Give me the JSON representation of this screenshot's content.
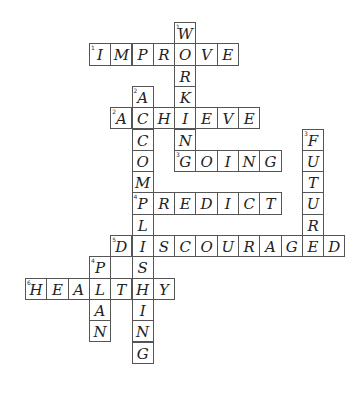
{
  "puzzle": {
    "cell_size": 21.3,
    "cells": [
      {
        "r": 0,
        "c": 7,
        "ch": "W",
        "n": "1"
      },
      {
        "r": 1,
        "c": 3,
        "ch": "I",
        "n": "1"
      },
      {
        "r": 1,
        "c": 4,
        "ch": "M"
      },
      {
        "r": 1,
        "c": 5,
        "ch": "P"
      },
      {
        "r": 1,
        "c": 6,
        "ch": "R"
      },
      {
        "r": 1,
        "c": 7,
        "ch": "O"
      },
      {
        "r": 1,
        "c": 8,
        "ch": "V"
      },
      {
        "r": 1,
        "c": 9,
        "ch": "E"
      },
      {
        "r": 2,
        "c": 7,
        "ch": "R"
      },
      {
        "r": 3,
        "c": 5,
        "ch": "A",
        "n": "2"
      },
      {
        "r": 3,
        "c": 7,
        "ch": "K"
      },
      {
        "r": 4,
        "c": 4,
        "ch": "A",
        "n": "2"
      },
      {
        "r": 4,
        "c": 5,
        "ch": "C"
      },
      {
        "r": 4,
        "c": 6,
        "ch": "H"
      },
      {
        "r": 4,
        "c": 7,
        "ch": "I"
      },
      {
        "r": 4,
        "c": 8,
        "ch": "E"
      },
      {
        "r": 4,
        "c": 9,
        "ch": "V"
      },
      {
        "r": 4,
        "c": 10,
        "ch": "E"
      },
      {
        "r": 5,
        "c": 5,
        "ch": "C"
      },
      {
        "r": 5,
        "c": 7,
        "ch": "N"
      },
      {
        "r": 5,
        "c": 13,
        "ch": "F",
        "n": "3"
      },
      {
        "r": 6,
        "c": 5,
        "ch": "O"
      },
      {
        "r": 6,
        "c": 7,
        "ch": "G",
        "n": "3"
      },
      {
        "r": 6,
        "c": 8,
        "ch": "O"
      },
      {
        "r": 6,
        "c": 9,
        "ch": "I"
      },
      {
        "r": 6,
        "c": 10,
        "ch": "N"
      },
      {
        "r": 6,
        "c": 11,
        "ch": "G"
      },
      {
        "r": 6,
        "c": 13,
        "ch": "U"
      },
      {
        "r": 7,
        "c": 5,
        "ch": "M"
      },
      {
        "r": 7,
        "c": 13,
        "ch": "T"
      },
      {
        "r": 8,
        "c": 5,
        "ch": "P",
        "n": "4"
      },
      {
        "r": 8,
        "c": 6,
        "ch": "R"
      },
      {
        "r": 8,
        "c": 7,
        "ch": "E"
      },
      {
        "r": 8,
        "c": 8,
        "ch": "D"
      },
      {
        "r": 8,
        "c": 9,
        "ch": "I"
      },
      {
        "r": 8,
        "c": 10,
        "ch": "C"
      },
      {
        "r": 8,
        "c": 11,
        "ch": "T"
      },
      {
        "r": 8,
        "c": 13,
        "ch": "U"
      },
      {
        "r": 9,
        "c": 5,
        "ch": "L"
      },
      {
        "r": 9,
        "c": 13,
        "ch": "R"
      },
      {
        "r": 10,
        "c": 4,
        "ch": "D",
        "n": "5"
      },
      {
        "r": 10,
        "c": 5,
        "ch": "I"
      },
      {
        "r": 10,
        "c": 6,
        "ch": "S"
      },
      {
        "r": 10,
        "c": 7,
        "ch": "C"
      },
      {
        "r": 10,
        "c": 8,
        "ch": "O"
      },
      {
        "r": 10,
        "c": 9,
        "ch": "U"
      },
      {
        "r": 10,
        "c": 10,
        "ch": "R"
      },
      {
        "r": 10,
        "c": 11,
        "ch": "A"
      },
      {
        "r": 10,
        "c": 12,
        "ch": "G"
      },
      {
        "r": 10,
        "c": 13,
        "ch": "E"
      },
      {
        "r": 10,
        "c": 14,
        "ch": "D"
      },
      {
        "r": 11,
        "c": 3,
        "ch": "P",
        "n": "4"
      },
      {
        "r": 11,
        "c": 5,
        "ch": "S"
      },
      {
        "r": 12,
        "c": 0,
        "ch": "H",
        "n": "6"
      },
      {
        "r": 12,
        "c": 1,
        "ch": "E"
      },
      {
        "r": 12,
        "c": 2,
        "ch": "A"
      },
      {
        "r": 12,
        "c": 3,
        "ch": "L"
      },
      {
        "r": 12,
        "c": 4,
        "ch": "T"
      },
      {
        "r": 12,
        "c": 5,
        "ch": "H"
      },
      {
        "r": 12,
        "c": 6,
        "ch": "Y"
      },
      {
        "r": 13,
        "c": 3,
        "ch": "A"
      },
      {
        "r": 13,
        "c": 5,
        "ch": "I"
      },
      {
        "r": 14,
        "c": 3,
        "ch": "N"
      },
      {
        "r": 14,
        "c": 5,
        "ch": "N"
      },
      {
        "r": 15,
        "c": 5,
        "ch": "G"
      }
    ],
    "words": {
      "across": [
        "IMPROVE",
        "ACHIEVE",
        "GOING",
        "PREDICT",
        "DISCOURAGED",
        "HEALTHY"
      ],
      "down": [
        "WORKING",
        "ACOMPLISHING",
        "FUTURE",
        "PLAN"
      ]
    }
  }
}
